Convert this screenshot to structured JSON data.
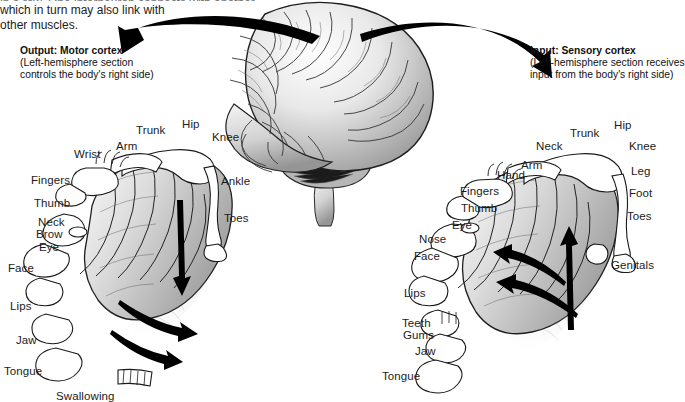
{
  "figure": {
    "background_color": "#ffffff",
    "text_color": "#1c1c1c"
  },
  "intro_text": {
    "line_cut": "in a row. One interneuron connects with another,",
    "line1": "which in turn may also link with",
    "line2": "other muscles."
  },
  "callouts": {
    "left": {
      "heading": "Output: Motor cortex",
      "line1": "(Left-hemisphere section",
      "line2": "controls the body's right side)"
    },
    "right": {
      "heading": "Input: Sensory cortex",
      "line1": "(Left-hemisphere section receives",
      "line2": "input from the body's right side)"
    }
  },
  "motor_labels": [
    {
      "text": "Wrist",
      "x": 74,
      "y": 148
    },
    {
      "text": "Arm",
      "x": 116,
      "y": 140
    },
    {
      "text": "Trunk",
      "x": 136,
      "y": 124
    },
    {
      "text": "Hip",
      "x": 182,
      "y": 118
    },
    {
      "text": "Knee",
      "x": 212,
      "y": 131
    },
    {
      "text": "Fingers",
      "x": 31,
      "y": 174
    },
    {
      "text": "Thumb",
      "x": 34,
      "y": 197
    },
    {
      "text": "Ankle",
      "x": 221,
      "y": 175
    },
    {
      "text": "Neck",
      "x": 38,
      "y": 216
    },
    {
      "text": "Brow",
      "x": 36,
      "y": 228
    },
    {
      "text": "Eye",
      "x": 39,
      "y": 241
    },
    {
      "text": "Toes",
      "x": 224,
      "y": 212
    },
    {
      "text": "Face",
      "x": 8,
      "y": 262
    },
    {
      "text": "Lips",
      "x": 10,
      "y": 300
    },
    {
      "text": "Jaw",
      "x": 16,
      "y": 334
    },
    {
      "text": "Tongue",
      "x": 4,
      "y": 365
    },
    {
      "text": "Swallowing",
      "x": 56,
      "y": 390
    }
  ],
  "sensory_labels": [
    {
      "text": "Neck",
      "x": 536,
      "y": 140
    },
    {
      "text": "Trunk",
      "x": 570,
      "y": 127
    },
    {
      "text": "Hip",
      "x": 614,
      "y": 119
    },
    {
      "text": "Knee",
      "x": 629,
      "y": 140
    },
    {
      "text": "Arm",
      "x": 521,
      "y": 159
    },
    {
      "text": "Hand",
      "x": 497,
      "y": 169
    },
    {
      "text": "Leg",
      "x": 631,
      "y": 165
    },
    {
      "text": "Fingers",
      "x": 460,
      "y": 185
    },
    {
      "text": "Foot",
      "x": 629,
      "y": 187
    },
    {
      "text": "Thumb",
      "x": 461,
      "y": 202
    },
    {
      "text": "Toes",
      "x": 627,
      "y": 210
    },
    {
      "text": "Eye",
      "x": 452,
      "y": 219
    },
    {
      "text": "Nose",
      "x": 419,
      "y": 233
    },
    {
      "text": "Face",
      "x": 414,
      "y": 250
    },
    {
      "text": "Genitals",
      "x": 611,
      "y": 259
    },
    {
      "text": "Lips",
      "x": 404,
      "y": 287
    },
    {
      "text": "Teeth",
      "x": 402,
      "y": 317
    },
    {
      "text": "Gums",
      "x": 403,
      "y": 329
    },
    {
      "text": "Jaw",
      "x": 415,
      "y": 345
    },
    {
      "text": "Tongue",
      "x": 382,
      "y": 370
    }
  ]
}
